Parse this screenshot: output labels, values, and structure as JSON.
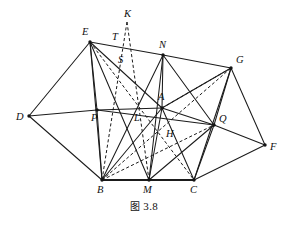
{
  "figure": {
    "caption_cjk": "图",
    "caption_number": "3.8",
    "caption_full": "图 3.8",
    "stroke_color": "#1b1b1b",
    "background_color": "#ffffff",
    "width": 288,
    "height": 226
  },
  "points": {
    "A": {
      "label": "A",
      "x": 162,
      "y": 108,
      "lx": 158,
      "ly": 100,
      "dot": true
    },
    "B": {
      "label": "B",
      "x": 102,
      "y": 180,
      "lx": 97,
      "ly": 193,
      "dot": true
    },
    "C": {
      "label": "C",
      "x": 194,
      "y": 180,
      "lx": 190,
      "ly": 193,
      "dot": true
    },
    "D": {
      "label": "D",
      "x": 29,
      "y": 116,
      "lx": 16,
      "ly": 120,
      "dot": true
    },
    "E": {
      "label": "E",
      "x": 90,
      "y": 42,
      "lx": 82,
      "ly": 35,
      "dot": true
    },
    "F": {
      "label": "F",
      "x": 265,
      "y": 145,
      "lx": 270,
      "ly": 150,
      "dot": true
    },
    "G": {
      "label": "G",
      "x": 231,
      "y": 68,
      "lx": 236,
      "ly": 63,
      "dot": true
    },
    "H": {
      "label": "H",
      "x": 172,
      "y": 137,
      "lx": 166,
      "ly": 137,
      "dot": false
    },
    "K": {
      "label": "K",
      "x": 127,
      "y": 22,
      "lx": 124,
      "ly": 17,
      "dot": false
    },
    "L": {
      "label": "L",
      "x": 139,
      "y": 121,
      "lx": 134,
      "ly": 121,
      "dot": false
    },
    "M": {
      "label": "M",
      "x": 149,
      "y": 180,
      "lx": 143,
      "ly": 193,
      "dot": true
    },
    "N": {
      "label": "N",
      "x": 163,
      "y": 55,
      "lx": 159,
      "ly": 48,
      "dot": true
    },
    "P": {
      "label": "P",
      "x": 97,
      "y": 110,
      "lx": 91,
      "ly": 121,
      "dot": true
    },
    "Q": {
      "label": "Q",
      "x": 214,
      "y": 125,
      "lx": 219,
      "ly": 122,
      "dot": true
    },
    "S": {
      "label": "S",
      "x": 122,
      "y": 62,
      "lx": 118,
      "ly": 63,
      "dot": false
    },
    "T": {
      "label": "T",
      "x": 117,
      "y": 41,
      "lx": 112,
      "ly": 40,
      "dot": false
    }
  },
  "edges_solid": [
    {
      "name": "D-E",
      "from": "D",
      "to": "E"
    },
    {
      "name": "E-N",
      "from": "E",
      "to": "N"
    },
    {
      "name": "N-G",
      "from": "N",
      "to": "G"
    },
    {
      "name": "G-F",
      "from": "G",
      "to": "F"
    },
    {
      "name": "F-C",
      "from": "F",
      "to": "C"
    },
    {
      "name": "D-B",
      "from": "D",
      "to": "B"
    },
    {
      "name": "D-P",
      "from": "D",
      "to": "P"
    },
    {
      "name": "P-A",
      "from": "P",
      "to": "A"
    },
    {
      "name": "A-Q",
      "from": "A",
      "to": "Q"
    },
    {
      "name": "Q-F",
      "from": "Q",
      "to": "F"
    },
    {
      "name": "E-P",
      "from": "E",
      "to": "P"
    },
    {
      "name": "P-B",
      "from": "P",
      "to": "B"
    },
    {
      "name": "E-B",
      "from": "E",
      "to": "B"
    },
    {
      "name": "E-A",
      "from": "E",
      "to": "A"
    },
    {
      "name": "N-A",
      "from": "N",
      "to": "A"
    },
    {
      "name": "N-M",
      "from": "N",
      "to": "M"
    },
    {
      "name": "N-Q",
      "from": "N",
      "to": "Q"
    },
    {
      "name": "A-B",
      "from": "A",
      "to": "B"
    },
    {
      "name": "A-M",
      "from": "A",
      "to": "M"
    },
    {
      "name": "A-C",
      "from": "A",
      "to": "C"
    },
    {
      "name": "A-G",
      "from": "A",
      "to": "G"
    },
    {
      "name": "G-Q",
      "from": "G",
      "to": "Q"
    },
    {
      "name": "G-C",
      "from": "G",
      "to": "C"
    },
    {
      "name": "Q-C",
      "from": "Q",
      "to": "C"
    },
    {
      "name": "Q-M",
      "from": "Q",
      "to": "M"
    },
    {
      "name": "P-Q",
      "from": "P",
      "to": "Q"
    },
    {
      "name": "E-M",
      "from": "E",
      "to": "M"
    },
    {
      "name": "B-N",
      "from": "B",
      "to": "N"
    }
  ],
  "edges_base": [
    {
      "name": "B-M",
      "from": "B",
      "to": "M"
    },
    {
      "name": "M-C",
      "from": "M",
      "to": "C"
    }
  ],
  "edges_dashed": [
    {
      "name": "K-B",
      "from": "K",
      "to": "B"
    },
    {
      "name": "K-S-M",
      "from": "K",
      "to": "M"
    },
    {
      "name": "E-H-C",
      "from": "E",
      "to": "C"
    },
    {
      "name": "B-H-G",
      "from": "B",
      "to": "G"
    },
    {
      "name": "A-G-dashed",
      "from": "A",
      "to": "G"
    },
    {
      "name": "B-Q",
      "from": "B",
      "to": "Q"
    }
  ],
  "labels_order": [
    "K",
    "E",
    "T",
    "N",
    "S",
    "G",
    "A",
    "D",
    "P",
    "L",
    "Q",
    "H",
    "F",
    "B",
    "M",
    "C"
  ]
}
